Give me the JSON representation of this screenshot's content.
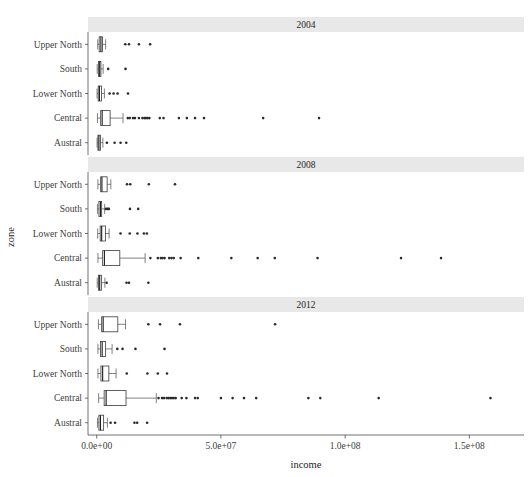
{
  "chart_data": {
    "type": "box",
    "title": "",
    "xlabel": "income",
    "ylabel": "zone",
    "xlim": [
      -3500000,
      172000000
    ],
    "xticks": [
      0,
      50000000,
      100000000,
      150000000
    ],
    "xtick_labels": [
      "0.0e+00",
      "5.0e+07",
      "1.0e+08",
      "1.5e+08"
    ],
    "categories": [
      "Upper North",
      "South",
      "Lower North",
      "Central",
      "Austral"
    ],
    "facet_variable": "year",
    "facets": [
      "2004",
      "2008",
      "2012"
    ],
    "grid": false,
    "legend": "none",
    "panels": [
      {
        "label": "2004",
        "boxes": [
          {
            "category": "Upper North",
            "min": 400000,
            "q1": 1000000,
            "median": 1700000,
            "q3": 2300000,
            "max": 3600000,
            "outliers": [
              11500000,
              13000000,
              17000000,
              21500000
            ]
          },
          {
            "category": "South",
            "min": 200000,
            "q1": 700000,
            "median": 1200000,
            "q3": 1700000,
            "max": 2600000,
            "outliers": [
              4600000,
              11600000
            ]
          },
          {
            "category": "Lower North",
            "min": 150000,
            "q1": 600000,
            "median": 1100000,
            "q3": 1900000,
            "max": 3100000,
            "outliers": [
              5200000,
              6800000,
              8400000,
              12600000
            ]
          },
          {
            "category": "Central",
            "min": 300000,
            "q1": 1600000,
            "median": 2200000,
            "q3": 5400000,
            "max": 10600000,
            "outliers": [
              12500000,
              13300000,
              14600000,
              15400000,
              17000000,
              18400000,
              19200000,
              19800000,
              20500000,
              21200000,
              25400000,
              26900000,
              33100000,
              36300000,
              39600000,
              43200000,
              67000000,
              89500000
            ]
          },
          {
            "category": "Austral",
            "min": 150000,
            "q1": 500000,
            "median": 900000,
            "q3": 1500000,
            "max": 2500000,
            "outliers": [
              4100000,
              7200000,
              9600000,
              11900000
            ]
          }
        ]
      },
      {
        "label": "2008",
        "boxes": [
          {
            "category": "Upper North",
            "min": 500000,
            "q1": 1600000,
            "median": 2100000,
            "q3": 4200000,
            "max": 5700000,
            "outliers": [
              12200000,
              13500000,
              21000000,
              31500000
            ]
          },
          {
            "category": "South",
            "min": 300000,
            "q1": 900000,
            "median": 1500000,
            "q3": 2000000,
            "max": 3200000,
            "outliers": [
              3700000,
              4400000,
              4900000,
              13400000,
              16700000
            ]
          },
          {
            "category": "Lower North",
            "min": 400000,
            "q1": 1400000,
            "median": 2000000,
            "q3": 3500000,
            "max": 5000000,
            "outliers": [
              9600000,
              13300000,
              16400000,
              19000000,
              20200000
            ]
          },
          {
            "category": "Central",
            "min": 500000,
            "q1": 2400000,
            "median": 3100000,
            "q3": 9300000,
            "max": 19500000,
            "outliers": [
              21600000,
              24600000,
              25800000,
              26500000,
              27300000,
              29200000,
              30100000,
              31000000,
              33800000,
              40900000,
              54200000,
              64800000,
              71700000,
              88900000,
              122500000,
              138600000
            ]
          },
          {
            "category": "Austral",
            "min": 200000,
            "q1": 700000,
            "median": 1200000,
            "q3": 1900000,
            "max": 3300000,
            "outliers": [
              4000000,
              12000000,
              13000000,
              20800000
            ]
          }
        ]
      },
      {
        "label": "2012",
        "boxes": [
          {
            "category": "Upper North",
            "min": 700000,
            "q1": 2000000,
            "median": 2600000,
            "q3": 8500000,
            "max": 11600000,
            "outliers": [
              20800000,
              25500000,
              33500000,
              71800000
            ]
          },
          {
            "category": "South",
            "min": 500000,
            "q1": 1500000,
            "median": 2200000,
            "q3": 3600000,
            "max": 6200000,
            "outliers": [
              8300000,
              10400000,
              15600000,
              27300000
            ]
          },
          {
            "category": "Lower North",
            "min": 500000,
            "q1": 1700000,
            "median": 2400000,
            "q3": 4900000,
            "max": 7800000,
            "outliers": [
              12100000,
              20400000,
              24600000,
              28300000
            ]
          },
          {
            "category": "Central",
            "min": 800000,
            "q1": 3000000,
            "median": 3800000,
            "q3": 11800000,
            "max": 24000000,
            "outliers": [
              24900000,
              26300000,
              27100000,
              28200000,
              28900000,
              29600000,
              30300000,
              31000000,
              31800000,
              34200000,
              36100000,
              39600000,
              40700000,
              50000000,
              54700000,
              59300000,
              64200000,
              85200000,
              90000000,
              113500000,
              158500000
            ]
          },
          {
            "category": "Austral",
            "min": 300000,
            "q1": 900000,
            "median": 1500000,
            "q3": 2800000,
            "max": 4300000,
            "outliers": [
              5600000,
              7400000,
              15200000,
              16300000,
              20300000
            ]
          }
        ]
      }
    ]
  },
  "colors": {
    "strip_background": "#e8e8e8",
    "panel_background": "#ffffff",
    "axis": "#4d4d4d",
    "box_stroke": "#3a3a3a",
    "outlier": "#2b2b2b"
  }
}
